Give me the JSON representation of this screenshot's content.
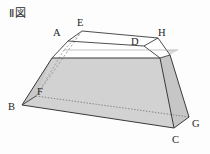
{
  "figure": {
    "title": "Ⅱ図",
    "caption_prefix": "Ⅱ",
    "caption_word": "図",
    "type": "truncated-pyramid-frustum",
    "colors": {
      "face_shaded": "#d2d2d2",
      "face_shaded_dark": "#c4c4c4",
      "face_shaded_light": "#dcdcdc",
      "face_white": "#ffffff",
      "stroke": "#3a3a3a",
      "stroke_hidden": "#7a7a7a",
      "background": "#fdfdfd",
      "label_text": "#1c1c1c"
    },
    "vertices": [
      {
        "id": "A",
        "label": "A",
        "label_x": 53,
        "label_y": 28,
        "px": 68,
        "py": 41
      },
      {
        "id": "E",
        "label": "E",
        "label_x": 77,
        "label_y": 18,
        "px": 82,
        "py": 31
      },
      {
        "id": "D",
        "label": "D",
        "label_x": 131,
        "label_y": 37,
        "px": 144,
        "py": 46
      },
      {
        "id": "H",
        "label": "H",
        "label_x": 158,
        "label_y": 28,
        "px": 158,
        "py": 38
      },
      {
        "id": "B",
        "label": "B",
        "label_x": 8,
        "label_y": 102,
        "px": 22,
        "py": 105
      },
      {
        "id": "F",
        "label": "F",
        "label_x": 37,
        "label_y": 87,
        "px": 36,
        "py": 96
      },
      {
        "id": "C",
        "label": "C",
        "label_x": 172,
        "label_y": 135,
        "px": 174,
        "py": 128
      },
      {
        "id": "G",
        "label": "G",
        "label_x": 192,
        "label_y": 119,
        "px": 189,
        "py": 117
      }
    ],
    "edges": [
      {
        "from": "A",
        "to": "E",
        "style": "solid"
      },
      {
        "from": "E",
        "to": "H",
        "style": "solid"
      },
      {
        "from": "A",
        "to": "D",
        "style": "solid"
      },
      {
        "from": "D",
        "to": "H",
        "style": "solid"
      },
      {
        "from": "B",
        "to": "C",
        "style": "solid"
      },
      {
        "from": "B",
        "to": "F",
        "style": "solid"
      },
      {
        "from": "F",
        "to": "G",
        "style": "dotted"
      },
      {
        "from": "C",
        "to": "G",
        "style": "solid"
      },
      {
        "from": "A",
        "to": "B",
        "style": "solid"
      },
      {
        "from": "D",
        "to": "C",
        "style": "solid"
      },
      {
        "from": "E",
        "to": "F",
        "style": "dashed-hidden"
      },
      {
        "from": "H",
        "to": "G",
        "style": "solid"
      }
    ],
    "notes": {
      "shaded_region": "lower frustum body below the upper rim",
      "white_region": "upper slab between top face and rim"
    }
  }
}
